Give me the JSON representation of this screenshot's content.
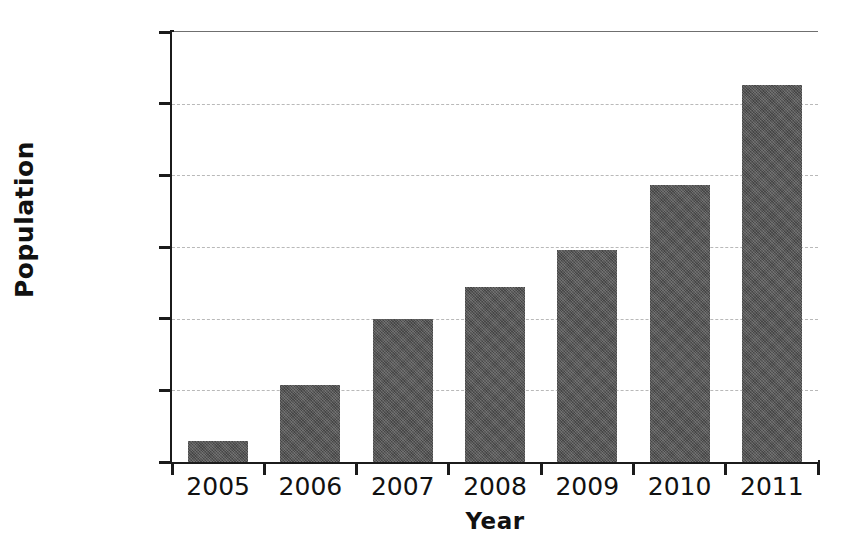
{
  "chart_data": {
    "type": "bar",
    "title": "",
    "xlabel": "Year",
    "ylabel": "Population",
    "categories": [
      "2005",
      "2006",
      "2007",
      "2008",
      "2009",
      "2010",
      "2011"
    ],
    "values": [
      14700,
      54000,
      99500,
      122000,
      148000,
      193000,
      263000
    ],
    "series": [
      {
        "name": "Population",
        "values": [
          14700,
          54000,
          99500,
          122000,
          148000,
          193000,
          263000
        ]
      }
    ],
    "ylim": [
      0,
      300000
    ],
    "ytick_values": [
      0,
      50000,
      100000,
      150000,
      200000,
      250000,
      300000
    ],
    "ytick_labels": [
      "0",
      "50 000",
      "100 000",
      "150 000",
      "200 000",
      "250 000",
      "300 000"
    ],
    "xtick_labels": [
      "2005",
      "2006",
      "2007",
      "2008",
      "2009",
      "2010",
      "2011"
    ],
    "grid": true,
    "grid_axis": "y",
    "grid_style": "dashed",
    "legend": false,
    "legend_position": "none",
    "bar_color": "#545454",
    "axis_color": "#1b1b1b",
    "grid_color": "#b9b9b9",
    "background_color": "#ffffff"
  }
}
